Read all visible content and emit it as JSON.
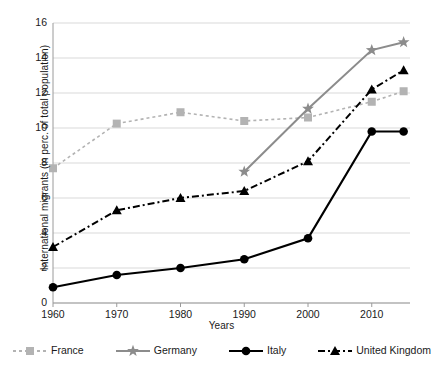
{
  "chart_data": {
    "type": "line",
    "title": "",
    "xlabel": "Years",
    "ylabel": "International migrants (in perc. of total population)",
    "x": [
      1960,
      1970,
      1980,
      1990,
      2000,
      2010,
      2015
    ],
    "xlim": [
      1960,
      2016
    ],
    "ylim": [
      0,
      16
    ],
    "ytick_values": [
      0,
      2,
      4,
      6,
      8,
      10,
      12,
      14,
      16
    ],
    "xtick_values": [
      1960,
      1970,
      1980,
      1990,
      2000,
      2010
    ],
    "grid": "horizontal",
    "legend_position": "bottom",
    "series": [
      {
        "name": "France",
        "color": "#b3b3b3",
        "marker": "square",
        "line_style": "dotted",
        "x": [
          1960,
          1970,
          1980,
          1990,
          2000,
          2010,
          2015
        ],
        "values": [
          7.7,
          10.25,
          10.9,
          10.4,
          10.6,
          11.5,
          12.1
        ]
      },
      {
        "name": "Germany",
        "color": "#8c8c8c",
        "marker": "star",
        "line_style": "solid",
        "x": [
          1990,
          2000,
          2010,
          2015
        ],
        "values": [
          7.5,
          11.1,
          14.45,
          14.9
        ]
      },
      {
        "name": "Italy",
        "color": "#000000",
        "marker": "circle",
        "line_style": "solid",
        "x": [
          1960,
          1970,
          1980,
          1990,
          2000,
          2010,
          2015
        ],
        "values": [
          0.9,
          1.6,
          2.0,
          2.5,
          3.7,
          9.8,
          9.8
        ]
      },
      {
        "name": "United Kingdom",
        "color": "#000000",
        "marker": "triangle",
        "line_style": "dashed",
        "x": [
          1960,
          1970,
          1980,
          1990,
          2000,
          2010,
          2015
        ],
        "values": [
          3.2,
          5.3,
          6.0,
          6.4,
          8.1,
          12.2,
          13.3
        ]
      }
    ]
  },
  "axis": {
    "y_title": "International migrants (in perc. of total population)",
    "x_title": "Years",
    "y_ticks": [
      "16",
      "14",
      "12",
      "10",
      "8",
      "6",
      "4",
      "2",
      "0"
    ],
    "x_ticks": [
      "1960",
      "1970",
      "1980",
      "1990",
      "2000",
      "2010"
    ]
  },
  "legend": {
    "items": [
      {
        "label": "France"
      },
      {
        "label": "Germany"
      },
      {
        "label": "Italy"
      },
      {
        "label": "United Kingdom"
      }
    ]
  }
}
